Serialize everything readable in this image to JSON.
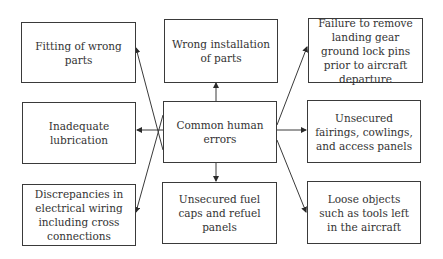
{
  "diagram": {
    "type": "hub-and-spoke",
    "center": {
      "id": "center",
      "label": "Common human errors"
    },
    "nodes": [
      {
        "id": "top_left",
        "label": "Fitting of wrong parts"
      },
      {
        "id": "top_center",
        "label": "Wrong installation of parts"
      },
      {
        "id": "top_right",
        "label": "Failure to remove landing gear ground lock pins prior to aircraft departure"
      },
      {
        "id": "mid_left",
        "label": "Inadequate lubrication"
      },
      {
        "id": "mid_right",
        "label": "Unsecured fairings, cowlings, and access panels"
      },
      {
        "id": "bottom_left",
        "label": "Discrepancies in electrical wiring including cross connections"
      },
      {
        "id": "bottom_center",
        "label": "Unsecured fuel caps and refuel panels"
      },
      {
        "id": "bottom_right",
        "label": "Loose objects such as tools left in the aircraft"
      }
    ],
    "edges": [
      {
        "from": "center",
        "to": "top_left"
      },
      {
        "from": "center",
        "to": "top_center"
      },
      {
        "from": "center",
        "to": "top_right"
      },
      {
        "from": "center",
        "to": "mid_left"
      },
      {
        "from": "center",
        "to": "mid_right"
      },
      {
        "from": "center",
        "to": "bottom_left"
      },
      {
        "from": "center",
        "to": "bottom_center"
      },
      {
        "from": "center",
        "to": "bottom_right"
      }
    ],
    "colors": {
      "stroke": "#3a3a3a",
      "text": "#333333",
      "background": "#ffffff"
    }
  }
}
